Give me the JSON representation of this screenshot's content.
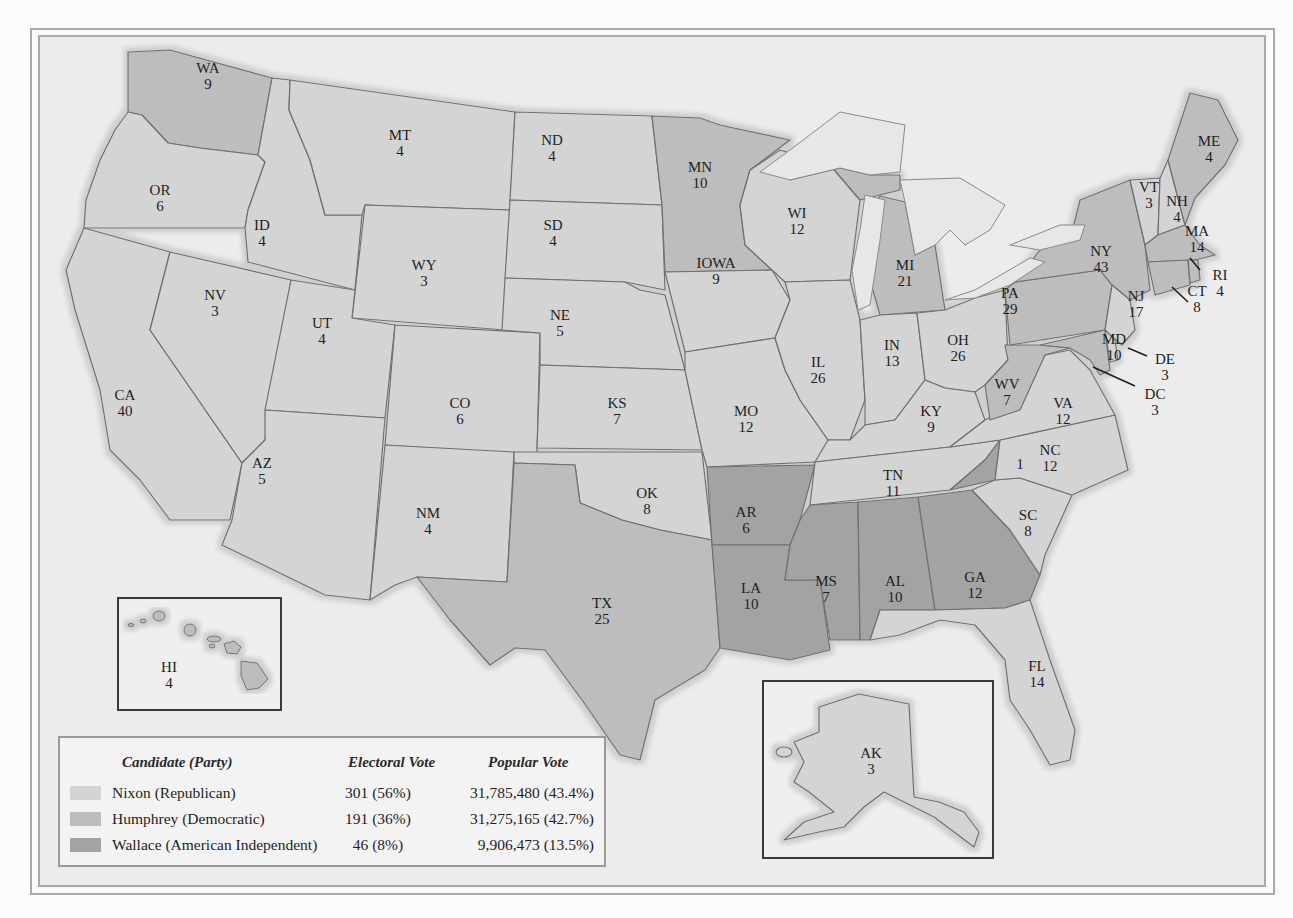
{
  "colors": {
    "nixon": "#d4d4d4",
    "humphrey": "#bdbdbd",
    "wallace": "#a3a3a3",
    "lake": "#e7e7e7",
    "background": "#ececec"
  },
  "legend": {
    "headers": {
      "candidate": "Candidate (Party)",
      "electoral": "Electoral Vote",
      "popular": "Popular Vote"
    },
    "rows": [
      {
        "name": "Nixon (Republican)",
        "electoral": "301 (56%)",
        "popular": "31,785,480 (43.4%)",
        "party": "nixon"
      },
      {
        "name": "Humphrey (Democratic)",
        "electoral": "191 (36%)",
        "popular": "31,275,165 (42.7%)",
        "party": "humphrey"
      },
      {
        "name": "Wallace (American Independent)",
        "electoral": "46 (8%)",
        "popular": "9,906,473 (13.5%)",
        "party": "wallace"
      }
    ]
  },
  "states": {
    "WA": {
      "abbr": "WA",
      "ev": "9",
      "party": "humphrey"
    },
    "OR": {
      "abbr": "OR",
      "ev": "6",
      "party": "nixon"
    },
    "CA": {
      "abbr": "CA",
      "ev": "40",
      "party": "nixon"
    },
    "ID": {
      "abbr": "ID",
      "ev": "4",
      "party": "nixon"
    },
    "NV": {
      "abbr": "NV",
      "ev": "3",
      "party": "nixon"
    },
    "MT": {
      "abbr": "MT",
      "ev": "4",
      "party": "nixon"
    },
    "WY": {
      "abbr": "WY",
      "ev": "3",
      "party": "nixon"
    },
    "UT": {
      "abbr": "UT",
      "ev": "4",
      "party": "nixon"
    },
    "AZ": {
      "abbr": "AZ",
      "ev": "5",
      "party": "nixon"
    },
    "CO": {
      "abbr": "CO",
      "ev": "6",
      "party": "nixon"
    },
    "NM": {
      "abbr": "NM",
      "ev": "4",
      "party": "nixon"
    },
    "ND": {
      "abbr": "ND",
      "ev": "4",
      "party": "nixon"
    },
    "SD": {
      "abbr": "SD",
      "ev": "4",
      "party": "nixon"
    },
    "NE": {
      "abbr": "NE",
      "ev": "5",
      "party": "nixon"
    },
    "KS": {
      "abbr": "KS",
      "ev": "7",
      "party": "nixon"
    },
    "OK": {
      "abbr": "OK",
      "ev": "8",
      "party": "nixon"
    },
    "TX": {
      "abbr": "TX",
      "ev": "25",
      "party": "humphrey"
    },
    "MN": {
      "abbr": "MN",
      "ev": "10",
      "party": "humphrey"
    },
    "IA": {
      "abbr": "IOWA",
      "ev": "9",
      "party": "nixon"
    },
    "MO": {
      "abbr": "MO",
      "ev": "12",
      "party": "nixon"
    },
    "AR": {
      "abbr": "AR",
      "ev": "6",
      "party": "wallace"
    },
    "LA": {
      "abbr": "LA",
      "ev": "10",
      "party": "wallace"
    },
    "WI": {
      "abbr": "WI",
      "ev": "12",
      "party": "nixon"
    },
    "IL": {
      "abbr": "IL",
      "ev": "26",
      "party": "nixon"
    },
    "MI": {
      "abbr": "MI",
      "ev": "21",
      "party": "humphrey"
    },
    "IN": {
      "abbr": "IN",
      "ev": "13",
      "party": "nixon"
    },
    "OH": {
      "abbr": "OH",
      "ev": "26",
      "party": "nixon"
    },
    "KY": {
      "abbr": "KY",
      "ev": "9",
      "party": "nixon"
    },
    "TN": {
      "abbr": "TN",
      "ev": "11",
      "party": "nixon"
    },
    "MS": {
      "abbr": "MS",
      "ev": "7",
      "party": "wallace"
    },
    "AL": {
      "abbr": "AL",
      "ev": "10",
      "party": "wallace"
    },
    "GA": {
      "abbr": "GA",
      "ev": "12",
      "party": "wallace"
    },
    "FL": {
      "abbr": "FL",
      "ev": "14",
      "party": "nixon"
    },
    "SC": {
      "abbr": "SC",
      "ev": "8",
      "party": "nixon"
    },
    "NC": {
      "abbr": "NC",
      "ev": "12",
      "party": "nixon"
    },
    "NC_WALLACE": {
      "abbr": "",
      "ev": "1",
      "party": "wallace"
    },
    "VA": {
      "abbr": "VA",
      "ev": "12",
      "party": "nixon"
    },
    "WV": {
      "abbr": "WV",
      "ev": "7",
      "party": "humphrey"
    },
    "PA": {
      "abbr": "PA",
      "ev": "29",
      "party": "humphrey"
    },
    "NY": {
      "abbr": "NY",
      "ev": "43",
      "party": "humphrey"
    },
    "VT": {
      "abbr": "VT",
      "ev": "3",
      "party": "nixon"
    },
    "NH": {
      "abbr": "NH",
      "ev": "4",
      "party": "nixon"
    },
    "ME": {
      "abbr": "ME",
      "ev": "4",
      "party": "humphrey"
    },
    "MA": {
      "abbr": "MA",
      "ev": "14",
      "party": "humphrey"
    },
    "RI": {
      "abbr": "RI",
      "ev": "4",
      "party": "humphrey"
    },
    "CT": {
      "abbr": "CT",
      "ev": "8",
      "party": "humphrey"
    },
    "NJ": {
      "abbr": "NJ",
      "ev": "17",
      "party": "nixon"
    },
    "DE": {
      "abbr": "DE",
      "ev": "3",
      "party": "nixon"
    },
    "MD": {
      "abbr": "MD",
      "ev": "10",
      "party": "humphrey"
    },
    "DC": {
      "abbr": "DC",
      "ev": "3",
      "party": "humphrey"
    },
    "HI": {
      "abbr": "HI",
      "ev": "4",
      "party": "humphrey"
    },
    "AK": {
      "abbr": "AK",
      "ev": "3",
      "party": "nixon"
    }
  }
}
